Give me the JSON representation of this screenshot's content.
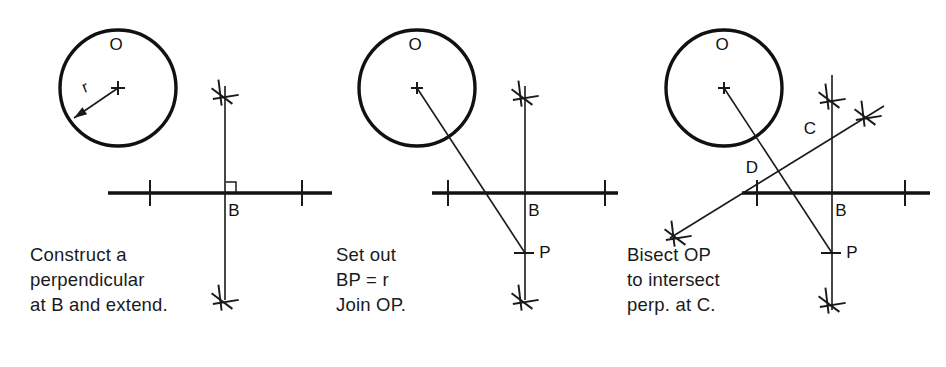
{
  "figure": {
    "width": 946,
    "height": 367,
    "background_color": "#ffffff",
    "ink_color": "#111111"
  },
  "panels": [
    {
      "id": "panel-1",
      "step_number": 1,
      "caption_lines": [
        "Construct a",
        "perpendicular",
        "at B and extend."
      ],
      "labels": {
        "center": "O",
        "radius": "r",
        "base_point": "B"
      },
      "geometry": {
        "circle": {
          "cx": 118,
          "cy": 88,
          "r": 58
        },
        "baseline": {
          "x1": 108,
          "y1": 193,
          "x2": 332,
          "y2": 193
        },
        "baseline_ticks_x": [
          150,
          302
        ],
        "perpendicular": {
          "x": 225,
          "y1": 86,
          "y2": 300
        },
        "arc_crosses": [
          {
            "cx": 225,
            "cy": 92
          },
          {
            "cx": 225,
            "cy": 297
          }
        ],
        "right_angle_marker": {
          "x": 225,
          "y": 193,
          "size": 11
        },
        "radius_arrow": {
          "x1": 118,
          "y1": 88,
          "x2": 74,
          "y2": 118
        }
      }
    },
    {
      "id": "panel-2",
      "step_number": 2,
      "caption_lines": [
        "Set out",
        "BP = r",
        "Join OP."
      ],
      "labels": {
        "center": "O",
        "base_point": "B",
        "radius_point": "P"
      },
      "geometry": {
        "circle": {
          "cx": 417,
          "cy": 88,
          "r": 58
        },
        "baseline": {
          "x1": 432,
          "y1": 193,
          "x2": 618,
          "y2": 193
        },
        "baseline_ticks_x": [
          448,
          605
        ],
        "perpendicular": {
          "x": 525,
          "y1": 86,
          "y2": 300
        },
        "arc_crosses": [
          {
            "cx": 525,
            "cy": 93
          },
          {
            "cx": 525,
            "cy": 297
          }
        ],
        "line_OP": {
          "x1": 417,
          "y1": 88,
          "x2": 525,
          "y2": 253
        },
        "point_P": {
          "x": 525,
          "y": 253
        }
      }
    },
    {
      "id": "panel-3",
      "step_number": 3,
      "caption_lines": [
        "Bisect OP",
        "to intersect",
        "perp. at C."
      ],
      "labels": {
        "center": "O",
        "base_point": "B",
        "radius_point": "P",
        "intersection_point": "C",
        "midpoint": "D"
      },
      "geometry": {
        "circle": {
          "cx": 724,
          "cy": 88,
          "r": 58
        },
        "baseline": {
          "x1": 742,
          "y1": 193,
          "x2": 930,
          "y2": 193
        },
        "baseline_ticks_x": [
          757,
          905
        ],
        "perpendicular": {
          "x": 832,
          "y1": 75,
          "y2": 310
        },
        "arc_crosses": [
          {
            "cx": 832,
            "cy": 96
          },
          {
            "cx": 832,
            "cy": 300
          },
          {
            "cx": 678,
            "cy": 233
          },
          {
            "cx": 868,
            "cy": 113
          }
        ],
        "line_OP": {
          "x1": 724,
          "y1": 88,
          "x2": 832,
          "y2": 253
        },
        "bisector": {
          "x1": 670,
          "y1": 238,
          "x2": 884,
          "y2": 106
        },
        "point_P": {
          "x": 832,
          "y": 253
        },
        "point_C": {
          "x": 832,
          "y": 140
        },
        "point_D": {
          "x": 778,
          "y": 170
        }
      }
    }
  ],
  "text_positions": {
    "panel1": {
      "O": {
        "x": 116,
        "y": 50
      },
      "r": {
        "x": 87,
        "y": 92
      },
      "B": {
        "x": 234,
        "y": 216
      },
      "caption_x": 30,
      "caption_y": 261,
      "caption_line_height": 25
    },
    "panel2": {
      "O": {
        "x": 415,
        "y": 50
      },
      "B": {
        "x": 534,
        "y": 216
      },
      "P": {
        "x": 545,
        "y": 258
      },
      "caption_x": 336,
      "caption_y": 261,
      "caption_line_height": 25
    },
    "panel3": {
      "O": {
        "x": 722,
        "y": 50
      },
      "B": {
        "x": 841,
        "y": 216
      },
      "P": {
        "x": 852,
        "y": 258
      },
      "C": {
        "x": 810,
        "y": 134
      },
      "D": {
        "x": 752,
        "y": 173
      },
      "caption_x": 627,
      "caption_y": 261,
      "caption_line_height": 25
    }
  }
}
